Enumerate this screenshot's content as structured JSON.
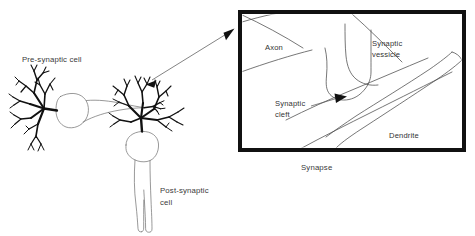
{
  "figure": {
    "background_color": "#ffffff",
    "ink_color": "#111111",
    "text_color": "#3a3a3a",
    "thin_line_color": "#6d6d6d"
  },
  "labels": {
    "pre_synaptic_cell": "Pre-synaptic cell",
    "post_synaptic_cell_line1": "Post-synaptic",
    "post_synaptic_cell_line2": "cell",
    "axon": "Axon",
    "synaptic_vessicle_line1": "Synaptic",
    "synaptic_vessicle_line2": "vessicle",
    "synaptic_cleft_line1": "Synaptic",
    "synaptic_cleft_line2": "cleft",
    "dendrite": "Dendrite",
    "synapse_caption": "Synapse"
  },
  "elements": {
    "zoom_arrow": "double-headed-arrow",
    "detail_panel": "synapse-detail-box",
    "cleft_pointer": "leader-arrow"
  }
}
